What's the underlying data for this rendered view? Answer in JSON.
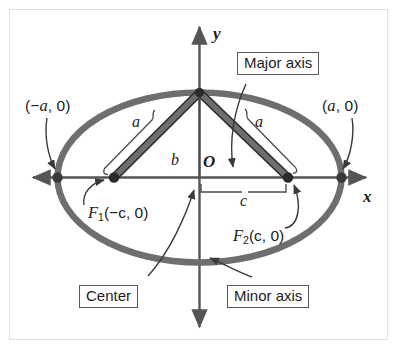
{
  "figure": {
    "type": "geometry-diagram",
    "background_color": "#ffffff",
    "frame_border_color": "#e2e2e2",
    "curve_color": "#666666",
    "axis_color": "#555555",
    "annotation_color": "#1c1c1c"
  },
  "axes": {
    "x_label": "x",
    "y_label": "y",
    "origin_label": "O"
  },
  "vertices": {
    "left_label": "(−a, 0)",
    "left_text": "(−",
    "left_var": "a",
    "left_tail": ", 0)",
    "right_label": "(a, 0)",
    "right_text": "(",
    "right_var": "a",
    "right_tail": ", 0)"
  },
  "foci": {
    "f1": {
      "symbol": "F",
      "subscript": "1",
      "coords": "(−c, 0)",
      "full": "F₁(−c, 0)"
    },
    "f2": {
      "symbol": "F",
      "subscript": "2",
      "coords": "(c, 0)",
      "full": "F₂(c, 0)"
    }
  },
  "measures": {
    "a_left": "a",
    "a_right": "a",
    "b": "b",
    "c": "c"
  },
  "callouts": [
    {
      "id": "major-axis",
      "label": "Major axis"
    },
    {
      "id": "center",
      "label": "Center"
    },
    {
      "id": "minor-axis",
      "label": "Minor axis"
    }
  ]
}
